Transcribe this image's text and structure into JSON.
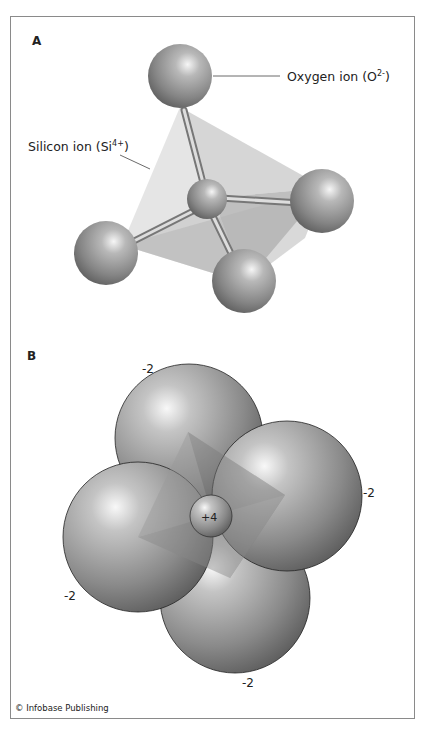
{
  "panel_a": {
    "label": "A",
    "oxygen_label": "Oxygen ion (O",
    "oxygen_sup": "2-",
    "oxygen_close": ")",
    "silicon_label": "Silicon ion (Si",
    "silicon_sup": "4+",
    "silicon_close": ")"
  },
  "panel_b": {
    "label": "B",
    "charges": {
      "top": "-2",
      "right": "-2",
      "left": "-2",
      "bottom": "-2",
      "center": "+4"
    }
  },
  "footer": {
    "copyright": "© Infobase Publishing"
  },
  "colors": {
    "sphere_dark": "#5a5a5a",
    "sphere_mid": "#8c8c8c",
    "sphere_light": "#f4f4f4",
    "frame": "#8a8a8a",
    "tetra_light": "#dcdcdc",
    "tetra_dark": "#a8a8a8"
  }
}
